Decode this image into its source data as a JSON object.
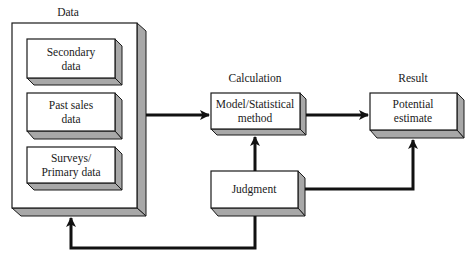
{
  "diagram": {
    "type": "flowchart",
    "colors": {
      "face": "#ffffff",
      "shadow": "#a8a8a8",
      "stroke": "#1a1a1a",
      "arrow": "#111111"
    },
    "section_labels": {
      "data": "Data",
      "calculation": "Calculation",
      "result": "Result"
    },
    "boxes": {
      "secondary": {
        "line1": "Secondary",
        "line2": "data"
      },
      "past_sales": {
        "line1": "Past sales",
        "line2": "data"
      },
      "surveys": {
        "line1": "Surveys/",
        "line2": "Primary data"
      },
      "model": {
        "line1": "Model/Statistical",
        "line2": "method"
      },
      "potential": {
        "line1": "Potential",
        "line2": "estimate"
      },
      "judgment": {
        "line1": "Judgment"
      }
    },
    "connections": [
      {
        "from": "data",
        "to": "model"
      },
      {
        "from": "model",
        "to": "potential"
      },
      {
        "from": "judgment",
        "to": "model"
      },
      {
        "from": "judgment",
        "to": "potential"
      },
      {
        "from": "judgment",
        "to": "data"
      }
    ]
  }
}
